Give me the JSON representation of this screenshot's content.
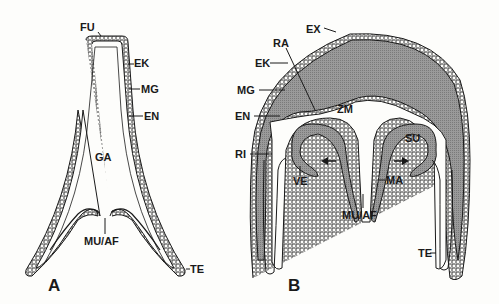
{
  "figure": {
    "panels": [
      {
        "id": "A",
        "label": "A",
        "labels": {
          "fu": "FU",
          "ek": "EK",
          "mg": "MG",
          "en": "EN",
          "ga": "GA",
          "mu_af": "MU/AF",
          "te": "TE"
        }
      },
      {
        "id": "B",
        "label": "B",
        "labels": {
          "ex": "EX",
          "ra": "RA",
          "ek": "EK",
          "mg": "MG",
          "en": "EN",
          "zm": "ZM",
          "su": "SU",
          "ri": "RI",
          "ve": "VE",
          "ma": "MA",
          "mu_af": "MU/AF",
          "te": "TE"
        }
      }
    ],
    "colors": {
      "background": "#fdfdfb",
      "outline": "#1a1a1a",
      "mesoglea_fill": "#8e8e8e"
    }
  }
}
